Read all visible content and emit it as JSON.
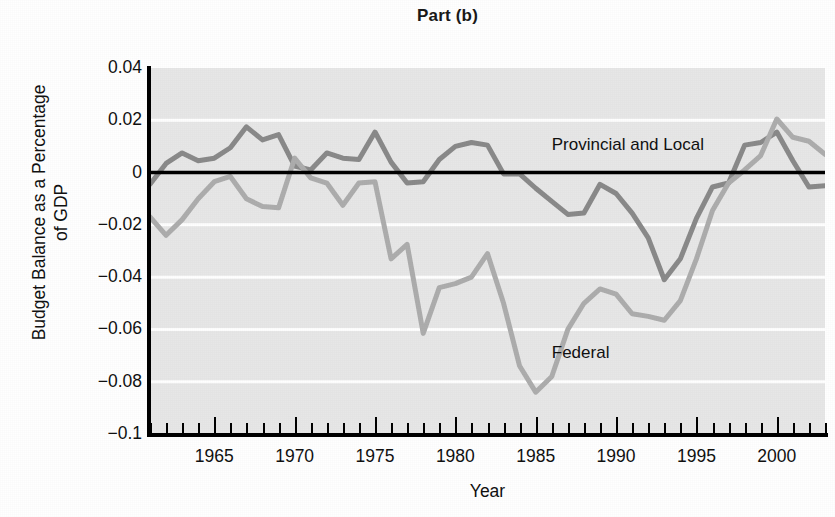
{
  "chart_data": {
    "type": "line",
    "title": "Part (b)",
    "xlabel": "Year",
    "ylabel_line1": "Budget Balance as a Percentage",
    "ylabel_line2": "of GDP",
    "xlim": [
      1961,
      2003
    ],
    "ylim": [
      -0.1,
      0.04
    ],
    "grid": "horizontal white gridlines at every 0.02",
    "legend_position": "inline labels on lines",
    "y_ticks": [
      "0.04",
      "0.02",
      "0",
      "−0.02",
      "−0.04",
      "−0.06",
      "−0.08",
      "−0.1"
    ],
    "y_tick_values": [
      0.04,
      0.02,
      0,
      -0.02,
      -0.04,
      -0.06,
      -0.08,
      -0.1
    ],
    "x_ticks": [
      "1965",
      "1970",
      "1975",
      "1980",
      "1985",
      "1990",
      "1995",
      "2000"
    ],
    "x_tick_values": [
      1965,
      1970,
      1975,
      1980,
      1985,
      1990,
      1995,
      2000
    ],
    "x_minor_tick_step": 1,
    "zero_line": 0,
    "colors": {
      "provincial_and_local": "#8a8a8a",
      "federal": "#adadad",
      "plot_background": "#e7e7e7",
      "gridline": "#ffffff",
      "axis": "#000000",
      "text": "#111111"
    },
    "x": [
      1961,
      1962,
      1963,
      1964,
      1965,
      1966,
      1967,
      1968,
      1969,
      1970,
      1971,
      1972,
      1973,
      1974,
      1975,
      1976,
      1977,
      1978,
      1979,
      1980,
      1981,
      1982,
      1983,
      1984,
      1985,
      1986,
      1987,
      1988,
      1989,
      1990,
      1991,
      1992,
      1993,
      1994,
      1995,
      1996,
      1997,
      1998,
      1999,
      2000,
      2001,
      2002,
      2003
    ],
    "series": [
      {
        "name": "Provincial and Local",
        "color": "#8a8a8a",
        "label_position": {
          "x": 1986,
          "y": 0.0105
        },
        "values": [
          -0.0045,
          0.0035,
          0.0075,
          0.0045,
          0.0055,
          0.0095,
          0.0175,
          0.0125,
          0.0145,
          0.0025,
          0.001,
          0.0075,
          0.0055,
          0.005,
          0.0155,
          0.004,
          -0.004,
          -0.0035,
          0.005,
          0.01,
          0.0115,
          0.0105,
          -0.0005,
          -0.0005,
          -0.006,
          -0.011,
          -0.016,
          -0.0155,
          -0.0045,
          -0.008,
          -0.0155,
          -0.025,
          -0.041,
          -0.033,
          -0.0175,
          -0.0055,
          -0.004,
          0.0105,
          0.0115,
          0.0155,
          0.0045,
          -0.0055,
          -0.005
        ]
      },
      {
        "name": "Federal",
        "color": "#adadad",
        "label_position": {
          "x": 1986,
          "y": -0.069
        },
        "values": [
          -0.017,
          -0.024,
          -0.018,
          -0.01,
          -0.0035,
          -0.0015,
          -0.01,
          -0.013,
          -0.0135,
          0.0055,
          -0.002,
          -0.004,
          -0.0125,
          -0.004,
          -0.0035,
          -0.033,
          -0.0275,
          -0.0615,
          -0.044,
          -0.0425,
          -0.04,
          -0.031,
          -0.05,
          -0.074,
          -0.084,
          -0.078,
          -0.06,
          -0.05,
          -0.0445,
          -0.0465,
          -0.054,
          -0.055,
          -0.0565,
          -0.049,
          -0.033,
          -0.0145,
          -0.004,
          0.001,
          0.0065,
          0.0205,
          0.0135,
          0.012,
          0.007
        ]
      }
    ]
  }
}
